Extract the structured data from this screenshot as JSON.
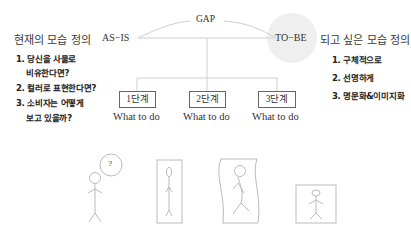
{
  "left": {
    "title": "현재의 모습 정의",
    "items": [
      "1. 당신을 사물로",
      "비유한다면?",
      "2. 컬러로 표현한다면?",
      "3. 소비자는 어떻게",
      "보고 있을까?"
    ]
  },
  "right": {
    "title": "되고 싶은 모습 정의",
    "items": [
      "1. 구체적으로",
      "2. 선명하게",
      "3. 명문화&이미지화"
    ]
  },
  "gap": {
    "as_is": "AS−IS",
    "to_be": "TO−BE",
    "gap_label": "GAP"
  },
  "steps": [
    {
      "label": "1단계",
      "sub": "What to do"
    },
    {
      "label": "2단계",
      "sub": "What to do"
    },
    {
      "label": "3단계",
      "sub": "What to do"
    }
  ],
  "figures": {
    "question_mark": "?"
  },
  "colors": {
    "line": "#c8c8c8",
    "circle_fill": "#efefef",
    "box_border": "#666666"
  }
}
